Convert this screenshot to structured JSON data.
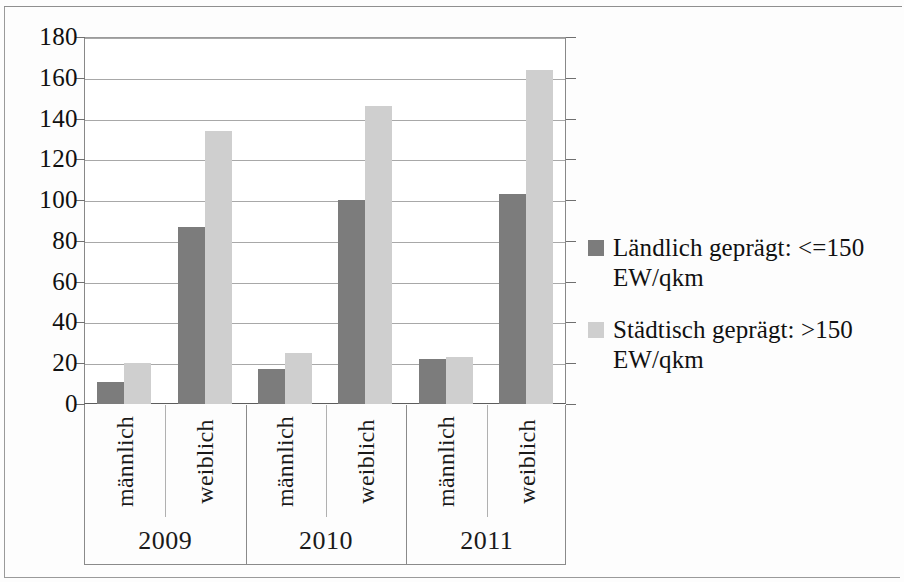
{
  "chart_data": {
    "type": "bar",
    "title": "",
    "subtitle": "",
    "xlabel": "",
    "ylabel": "",
    "ylim": [
      0,
      180
    ],
    "yticks": [
      0,
      20,
      40,
      60,
      80,
      100,
      120,
      140,
      160,
      180
    ],
    "ytick_labels": [
      "0",
      "20",
      "40",
      "60",
      "80",
      "100",
      "120",
      "140",
      "160",
      "180"
    ],
    "grid": true,
    "legend_position": "right",
    "groups": [
      {
        "label": "2009",
        "categories": [
          "männlich",
          "weiblich"
        ]
      },
      {
        "label": "2010",
        "categories": [
          "männlich",
          "weiblich"
        ]
      },
      {
        "label": "2011",
        "categories": [
          "männlich",
          "weiblich"
        ]
      }
    ],
    "categories": [
      "2009 männlich",
      "2009 weiblich",
      "2010 männlich",
      "2010 weiblich",
      "2011 männlich",
      "2011 weiblich"
    ],
    "series": [
      {
        "name": "Ländlich geprägt: <=150 EW/qkm",
        "color": "#7c7c7c",
        "values": [
          11,
          87,
          17,
          100,
          22,
          103
        ]
      },
      {
        "name": "Städtisch geprägt: >150 EW/qkm",
        "color": "#cfcfcf",
        "values": [
          20,
          134,
          25,
          146,
          23,
          164
        ]
      }
    ]
  },
  "legend": {
    "entries": [
      {
        "swatch": "rural",
        "line1": "Ländlich geprägt: <=150",
        "line2": "EW/qkm"
      },
      {
        "swatch": "urban",
        "line1": "Städtisch geprägt: >150",
        "line2": "EW/qkm"
      }
    ]
  }
}
